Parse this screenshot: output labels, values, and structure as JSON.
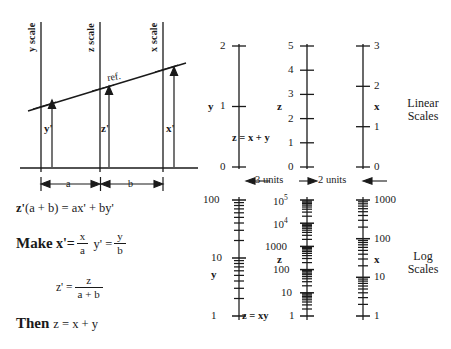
{
  "figure": {
    "title_hidden": "",
    "left_diagram": {
      "axis_labels": [
        {
          "id": "y-scale",
          "text": "y scale"
        },
        {
          "id": "z-scale",
          "text": "z scale"
        },
        {
          "id": "x-scale",
          "text": "x scale"
        }
      ],
      "reference_line_label": "ref.",
      "value_labels": [
        {
          "id": "y-prime",
          "text": "y'"
        },
        {
          "id": "z-prime",
          "text": "z'"
        },
        {
          "id": "x-prime",
          "text": "x'"
        }
      ],
      "distance_labels": [
        {
          "id": "dist-a",
          "text": "a"
        },
        {
          "id": "dist-b",
          "text": "b"
        }
      ]
    },
    "equations": {
      "line1": "z'(a + b) = ax' + by'",
      "line1_lead": "z'",
      "line1_rest": "(a + b) = ax' + by'",
      "make_word": "Make",
      "make_lhs1": "x'=",
      "make_frac1_num": "x",
      "make_frac1_den": "a",
      "make_lhs2": "y' =",
      "make_frac2_num": "y",
      "make_frac2_den": "b",
      "zprime_lhs": "z' =",
      "zprime_num": "z",
      "zprime_den": "a + b",
      "then_word": "Then",
      "then_eq": "z = x + y"
    },
    "linear_scales": {
      "group_label_line1": "Linear",
      "group_label_line2": "Scales",
      "relation": "z = x + y",
      "y_axis": {
        "name": "y",
        "ticks": [
          "0",
          "1",
          "2"
        ],
        "min": 0,
        "max": 2,
        "label_side": "left"
      },
      "z_axis": {
        "name": "z",
        "ticks": [
          "0",
          "1",
          "2",
          "3",
          "4",
          "5"
        ],
        "min": 0,
        "max": 5,
        "label_side": "left"
      },
      "x_axis": {
        "name": "x",
        "ticks": [
          "0",
          "1",
          "2",
          "3"
        ],
        "min": 0,
        "max": 3,
        "label_side": "right"
      },
      "spacing_left": "3 units",
      "spacing_right": "2 units"
    },
    "log_scales": {
      "group_label_line1": "Log",
      "group_label_line2": "Scales",
      "relation": "z = xy",
      "y_axis": {
        "name": "y",
        "ticks": [
          "1",
          "10",
          "100"
        ],
        "decades": 2,
        "label_side": "left"
      },
      "z_axis": {
        "name": "z",
        "ticks": [
          "1",
          "10",
          "100",
          "1000",
          "10^4",
          "10^5"
        ],
        "decades": 5,
        "label_side": "left"
      },
      "x_axis": {
        "name": "x",
        "ticks": [
          "1",
          "10",
          "100",
          "1000"
        ],
        "decades": 3,
        "label_side": "right"
      },
      "z_tick_display": [
        {
          "mantissa": "1",
          "exp": ""
        },
        {
          "mantissa": "10",
          "exp": ""
        },
        {
          "mantissa": "100",
          "exp": ""
        },
        {
          "mantissa": "1000",
          "exp": ""
        },
        {
          "mantissa": "10",
          "exp": "4"
        },
        {
          "mantissa": "10",
          "exp": "5"
        }
      ]
    },
    "colors": {
      "ink": "#1a1a1a",
      "background": "#ffffff"
    }
  }
}
